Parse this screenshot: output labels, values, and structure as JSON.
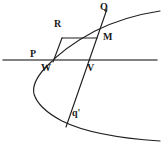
{
  "figure": {
    "type": "geometry-diagram",
    "canvas": {
      "width": 164,
      "height": 150,
      "background": "#ffffff"
    },
    "stroke_color": "#1f1f1f",
    "axis_color": "#555555",
    "labels": [
      {
        "id": "P",
        "text": "P",
        "x": 30,
        "y": 49,
        "size": 10
      },
      {
        "id": "R",
        "text": "R",
        "x": 54,
        "y": 19,
        "size": 10
      },
      {
        "id": "Q",
        "text": "Q",
        "x": 100,
        "y": 2,
        "size": 10
      },
      {
        "id": "M",
        "text": "M",
        "x": 103,
        "y": 32,
        "size": 10
      },
      {
        "id": "W",
        "text": "W",
        "x": 41,
        "y": 63,
        "size": 10
      },
      {
        "id": "V",
        "text": "V",
        "x": 87,
        "y": 63,
        "size": 10
      },
      {
        "id": "qprime",
        "text": "q'",
        "x": 72,
        "y": 108,
        "size": 10
      }
    ],
    "points": {
      "P": {
        "x": 42,
        "y": 60
      },
      "R": {
        "x": 62,
        "y": 38
      },
      "Q": {
        "x": 104,
        "y": 14
      },
      "M": {
        "x": 96,
        "y": 38
      },
      "W": {
        "x": 54,
        "y": 60
      },
      "V": {
        "x": 88,
        "y": 60
      },
      "qprime": {
        "x": 70,
        "y": 118
      }
    },
    "elements": [
      {
        "name": "parabola-curve",
        "kind": "curve"
      },
      {
        "name": "horizontal-axis-line",
        "kind": "line"
      },
      {
        "name": "chord-Q-qprime",
        "kind": "line"
      },
      {
        "name": "segment-R-W",
        "kind": "line"
      },
      {
        "name": "segment-R-M",
        "kind": "line"
      }
    ]
  }
}
